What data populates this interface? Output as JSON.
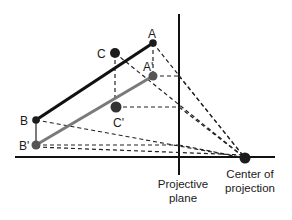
{
  "diagram": {
    "type": "perspective-projection",
    "points": {
      "A": {
        "label": "A",
        "x": 153,
        "y": 43
      },
      "A_prime": {
        "label": "A'",
        "x": 153,
        "y": 76
      },
      "C": {
        "label": "C",
        "x": 115,
        "y": 53
      },
      "C_prime": {
        "label": "C'",
        "x": 116,
        "y": 107
      },
      "B": {
        "label": "B",
        "x": 36,
        "y": 120
      },
      "B_prime": {
        "label": "B'",
        "x": 36,
        "y": 145
      },
      "center": {
        "x": 245,
        "y": 158
      }
    },
    "labels": {
      "plane_line1": "Projective",
      "plane_line2": "plane",
      "center_line1": "Center of",
      "center_line2": "projection"
    },
    "colors": {
      "line_dark": "#111111",
      "line_grey": "#777777",
      "point_dark": "#1c1c1c",
      "point_grey": "#555555",
      "dashed": "#222222"
    }
  }
}
